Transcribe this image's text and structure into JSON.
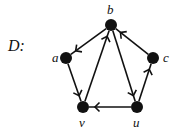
{
  "graph": {
    "name": "D:",
    "directed": true,
    "nodes": [
      {
        "id": "b",
        "label": "b",
        "x": 111,
        "y": 25,
        "lx": 107,
        "ly": 3
      },
      {
        "id": "a",
        "label": "a",
        "x": 66,
        "y": 58,
        "lx": 52,
        "ly": 51
      },
      {
        "id": "c",
        "label": "c",
        "x": 153,
        "y": 58,
        "lx": 163,
        "ly": 51
      },
      {
        "id": "v",
        "label": "v",
        "x": 83,
        "y": 107,
        "lx": 79,
        "ly": 116
      },
      {
        "id": "u",
        "label": "u",
        "x": 137,
        "y": 107,
        "lx": 133,
        "ly": 116
      }
    ],
    "edges": [
      {
        "from": "b",
        "to": "a"
      },
      {
        "from": "a",
        "to": "v"
      },
      {
        "from": "v",
        "to": "b"
      },
      {
        "from": "b",
        "to": "u"
      },
      {
        "from": "u",
        "to": "v"
      },
      {
        "from": "u",
        "to": "c"
      },
      {
        "from": "c",
        "to": "b"
      }
    ],
    "colors": {
      "node": "#111111",
      "edge": "#111111"
    }
  }
}
